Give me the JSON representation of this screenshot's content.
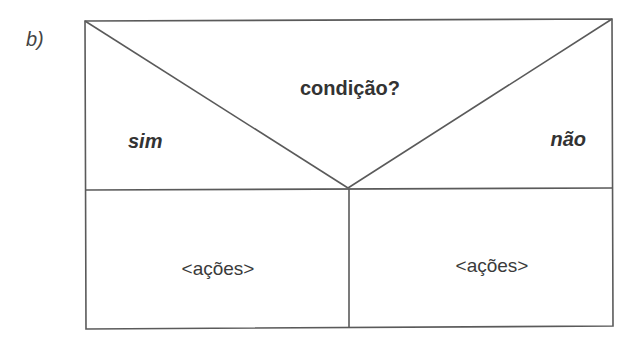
{
  "figure_label": "b)",
  "diagram": {
    "type": "nassi-shneiderman-if-else",
    "condition": "condição?",
    "true_branch_label": "sim",
    "false_branch_label": "não",
    "true_actions": "<ações>",
    "false_actions": "<ações>",
    "colors": {
      "line": "#5a5a5a",
      "text": "#333333",
      "background": "#ffffff"
    }
  }
}
